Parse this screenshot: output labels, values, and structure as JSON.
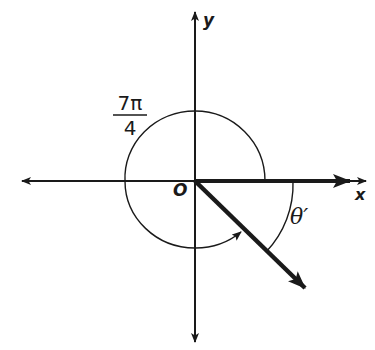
{
  "diagram": {
    "type": "angle-in-standard-position",
    "origin_label": "O",
    "x_axis_label": "x",
    "y_axis_label": "y",
    "angle_label": {
      "numerator": "7π",
      "denominator": "4"
    },
    "reference_angle_label": "θ′",
    "colors": {
      "stroke": "#1a1a1a",
      "background": "#ffffff"
    }
  }
}
